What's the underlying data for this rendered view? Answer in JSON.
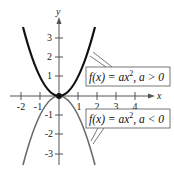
{
  "figure": {
    "x_axis_label": "x",
    "y_axis_label": "y",
    "x_ticks": [
      "-2",
      "-1",
      "1",
      "2",
      "3",
      "4"
    ],
    "y_ticks": [
      "3",
      "2",
      "1",
      "-1",
      "-2",
      "-3"
    ],
    "labels": {
      "upward": {
        "prefix": "f(x) = ax",
        "exponent": "2",
        "suffix": ", a > 0"
      },
      "downward": {
        "prefix": "f(x) = ax",
        "exponent": "2",
        "suffix": ", a < 0"
      }
    },
    "colors": {
      "upward_curve": "#111111",
      "downward_curve": "#6a6a6a",
      "axes": "#555555"
    }
  }
}
